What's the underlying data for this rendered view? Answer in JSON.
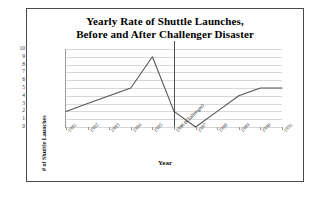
{
  "figure": {
    "border_color": "#4a4a4a",
    "background": "#ffffff"
  },
  "title": {
    "line1": "Yearly Rate of Shuttle Launches,",
    "line2": "Before and After Challenger Disaster"
  },
  "chart_data": {
    "type": "line",
    "title": "Yearly Rate of Shuttle Launches, Before and After Challenger Disaster",
    "xlabel": "Year",
    "ylabel": "# of Shuttle Launches",
    "categories": [
      "1981",
      "1982",
      "1983",
      "1984",
      "1985",
      "1986 (Challenger)",
      "1987",
      "1988",
      "1989",
      "1990",
      "1991"
    ],
    "values": [
      2,
      3,
      4,
      5,
      9,
      2,
      0,
      2,
      4,
      5,
      5
    ],
    "ylim": [
      0,
      10
    ],
    "yticks": [
      10,
      9,
      8,
      7,
      6,
      5,
      4,
      3,
      2,
      1,
      0
    ],
    "grid": true,
    "legend": "none",
    "line_color": "#555555",
    "annotations": [
      {
        "name": "challenger-marker",
        "at_category": "1986 (Challenger)",
        "label": "1986 (Challenger)",
        "color": "#4f4f4f"
      }
    ]
  }
}
